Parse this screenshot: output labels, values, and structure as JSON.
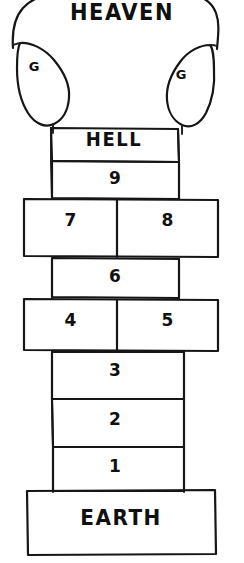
{
  "diagram": {
    "title": "HEAVEN",
    "style": "hand-drawn sketch",
    "ink_color": "#161616",
    "background_color": "#ffffff",
    "top_region": {
      "label": "HEAVEN",
      "shape": "dome",
      "gates": [
        {
          "label": "G",
          "side": "left",
          "shape": "teardrop"
        },
        {
          "label": "G",
          "side": "right",
          "shape": "teardrop"
        }
      ]
    },
    "ladder": {
      "rungs": [
        {
          "label": "HELL",
          "width": "narrow",
          "kind": "named"
        },
        {
          "label": "9",
          "width": "narrow",
          "kind": "numbered"
        },
        {
          "label": "7",
          "width": "wide-left",
          "kind": "numbered"
        },
        {
          "label": "8",
          "width": "wide-right",
          "kind": "numbered"
        },
        {
          "label": "6",
          "width": "narrow",
          "kind": "numbered"
        },
        {
          "label": "4",
          "width": "wide-left",
          "kind": "numbered"
        },
        {
          "label": "5",
          "width": "wide-right",
          "kind": "numbered"
        },
        {
          "label": "3",
          "width": "narrow",
          "kind": "numbered"
        },
        {
          "label": "2",
          "width": "narrow",
          "kind": "numbered"
        },
        {
          "label": "1",
          "width": "narrow",
          "kind": "numbered"
        }
      ]
    },
    "bottom_region": {
      "label": "EARTH",
      "shape": "rectangle"
    }
  }
}
